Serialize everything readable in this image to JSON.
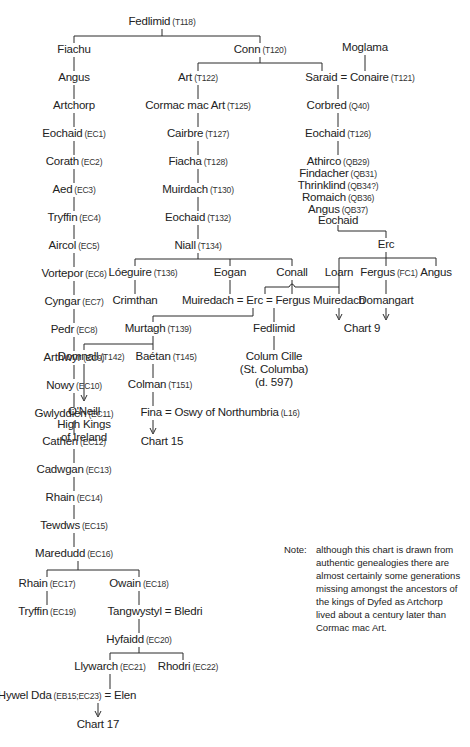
{
  "chart_title": "Genealogy chart: descendants of Fedlimid",
  "nodes": {
    "fedlimid": {
      "name": "Fedlimid",
      "ref": "(T118)"
    },
    "fiachu": {
      "name": "Fiachu",
      "ref": ""
    },
    "conn": {
      "name": "Conn",
      "ref": "(T120)"
    },
    "moglama": {
      "name": "Moglama",
      "ref": ""
    },
    "angus_l": {
      "name": "Angus",
      "ref": ""
    },
    "art": {
      "name": "Art",
      "ref": "(T122)"
    },
    "saraid_conaire": {
      "name": "Saraid = Conaire",
      "ref": "(T121)"
    },
    "artchorp": {
      "name": "Artchorp",
      "ref": ""
    },
    "cormac": {
      "name": "Cormac mac Art",
      "ref": "(T125)"
    },
    "corbred": {
      "name": "Corbred",
      "ref": "(Q40)"
    },
    "eochaid_ec1": {
      "name": "Eochaid",
      "ref": "(EC1)"
    },
    "cairbre": {
      "name": "Cairbre",
      "ref": "(T127)"
    },
    "eochaid_t126": {
      "name": "Eochaid",
      "ref": "(T126)"
    },
    "corath": {
      "name": "Corath",
      "ref": "(EC2)"
    },
    "fiacha": {
      "name": "Fiacha",
      "ref": "(T128)"
    },
    "athirco": {
      "name": "Athirco",
      "ref": "(QB29)"
    },
    "findacher": {
      "name": "Findacher",
      "ref": "(QB31)"
    },
    "thrinklind": {
      "name": "Thrinklind",
      "ref": "(QB34?)"
    },
    "romaich": {
      "name": "Romaich",
      "ref": "(QB36)"
    },
    "angus_qb37": {
      "name": "Angus",
      "ref": "(QB37)"
    },
    "eochaid_r": {
      "name": "Eochaid",
      "ref": ""
    },
    "aed": {
      "name": "Aed",
      "ref": "(EC3)"
    },
    "muirdach": {
      "name": "Muirdach",
      "ref": "(T130)"
    },
    "tryffin_ec4": {
      "name": "Tryffin",
      "ref": "(EC4)"
    },
    "eochaid_t132": {
      "name": "Eochaid",
      "ref": "(T132)"
    },
    "aircol": {
      "name": "Aircol",
      "ref": "(EC5)"
    },
    "niall": {
      "name": "Niall",
      "ref": "(T134)"
    },
    "erc_r": {
      "name": "Erc",
      "ref": ""
    },
    "vortepor": {
      "name": "Vortepor",
      "ref": "(EC6)"
    },
    "loeguire": {
      "name": "Lóeguire",
      "ref": "(T136)"
    },
    "eogan": {
      "name": "Eogan",
      "ref": ""
    },
    "conall": {
      "name": "Conall",
      "ref": ""
    },
    "loarn": {
      "name": "Loarn",
      "ref": ""
    },
    "fergus_fc1": {
      "name": "Fergus",
      "ref": "(FC1)"
    },
    "angus_r": {
      "name": "Angus",
      "ref": ""
    },
    "cyngar": {
      "name": "Cyngar",
      "ref": "(EC7)"
    },
    "crimthan": {
      "name": "Crimthan",
      "ref": ""
    },
    "muiredach_erc_fergus": {
      "name": "Muiredach = Erc = Fergus",
      "ref": ""
    },
    "muiredach_r": {
      "name": "Muiredach",
      "ref": ""
    },
    "domangart": {
      "name": "Domangart",
      "ref": ""
    },
    "pedr": {
      "name": "Pedr",
      "ref": "(EC8)"
    },
    "murtagh": {
      "name": "Murtagh",
      "ref": "(T139)"
    },
    "fedlimid2": {
      "name": "Fedlimid",
      "ref": ""
    },
    "chart9": {
      "name": "Chart 9",
      "ref": ""
    },
    "arthwyr": {
      "name": "Arthwyr",
      "ref": "(EC9)"
    },
    "domnall": {
      "name": "Domnall",
      "ref": "(T142)"
    },
    "baetan": {
      "name": "Baétan",
      "ref": "(T145)"
    },
    "colum_cille": {
      "line1": "Colum Cille",
      "line2": "(St. Columba)",
      "line3": "(d. 597)"
    },
    "nowy": {
      "name": "Nowy",
      "ref": "(EC10)"
    },
    "colman": {
      "name": "Colman",
      "ref": "(T151)"
    },
    "gwlyddien": {
      "name": "Gwlyddien",
      "ref": "(EC11)"
    },
    "oneill": {
      "line1": "O'Neill",
      "line2": "High Kings",
      "line3": "of Ireland"
    },
    "fina_oswy": {
      "name": "Fina = Oswy of Northumbria",
      "ref": "(L16)"
    },
    "cathen": {
      "name": "Cathen",
      "ref": "(EC12)"
    },
    "chart15": {
      "name": "Chart 15",
      "ref": ""
    },
    "cadwgan": {
      "name": "Cadwgan",
      "ref": "(EC13)"
    },
    "rhain_ec14": {
      "name": "Rhain",
      "ref": "(EC14)"
    },
    "tewdws": {
      "name": "Tewdws",
      "ref": "(EC15)"
    },
    "maredudd": {
      "name": "Maredudd",
      "ref": "(EC16)"
    },
    "rhain_ec17": {
      "name": "Rhain",
      "ref": "(EC17)"
    },
    "owain": {
      "name": "Owain",
      "ref": "(EC18)"
    },
    "tryffin_ec19": {
      "name": "Tryffin",
      "ref": "(EC19)"
    },
    "tangwystyl": {
      "name": "Tangwystyl = Bledri",
      "ref": ""
    },
    "hyfaidd": {
      "name": "Hyfaidd",
      "ref": "(EC20)"
    },
    "llywarch": {
      "name": "Llywarch",
      "ref": "(EC21)"
    },
    "rhodri": {
      "name": "Rhodri",
      "ref": "(EC22)"
    },
    "hywel_pre": {
      "name": "Hywel Dda",
      "ref": "(EB15;EC23)"
    },
    "hywel_post": {
      "name": "= Elen",
      "ref": ""
    },
    "chart17": {
      "name": "Chart 17",
      "ref": ""
    }
  },
  "note": {
    "label": "Note:",
    "text": "although this chart is drawn from authentic genealogies there are almost certainly some generations missing amongst the ancestors of the kings of Dyfed as Artchorp lived about a century later than Cormac mac Art."
  }
}
